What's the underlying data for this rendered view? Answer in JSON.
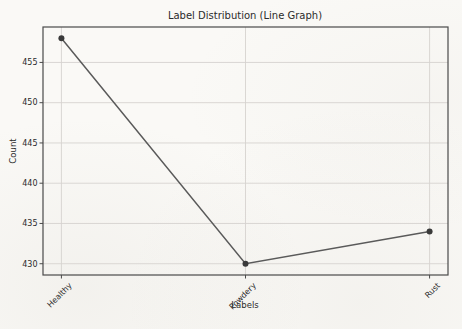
{
  "chart_data": {
    "type": "line",
    "title": "Label Distribution (Line Graph)",
    "xlabel": "Labels",
    "ylabel": "Count",
    "categories": [
      "Healthy",
      "Powdery",
      "Rust"
    ],
    "values": [
      458,
      430,
      434
    ],
    "yticks": [
      430,
      435,
      440,
      445,
      450,
      455
    ],
    "ylim": [
      428.6,
      459.4
    ],
    "xlim": [
      -0.1,
      2.1
    ],
    "grid": true,
    "legend": "none",
    "x_tick_rotation": 45,
    "colors": {
      "line": "#5a5a5a",
      "marker": "#3a3a3a",
      "grid": "#d6d3cf",
      "spine": "#4a4a4a",
      "text": "#2b2b2b",
      "background": "#faf9f6"
    }
  }
}
